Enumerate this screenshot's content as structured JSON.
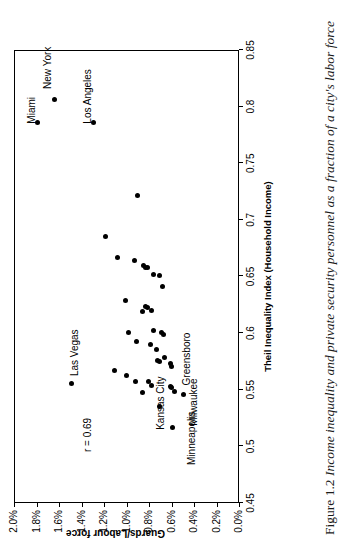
{
  "figure": {
    "number": "Figure 1.2",
    "caption": "Income inequality and private security personnel as a fraction of a city's labor force",
    "full_caption": "Figure 1.2  Income inequality and private security personnel as a fraction of a city's labor force"
  },
  "chart_data": {
    "type": "scatter",
    "title": "",
    "xlabel": "Theil Inequality Index (Household Income)",
    "ylabel": "Guards/Labour force",
    "xlim": [
      0.45,
      0.85
    ],
    "ylim": [
      0.0,
      2.0
    ],
    "xticks": [
      0.45,
      0.5,
      0.55,
      0.6,
      0.65,
      0.7,
      0.75,
      0.8,
      0.85
    ],
    "xticklabels": [
      "0.45",
      "0.5",
      "0.55",
      "0.6",
      "0.65",
      "0.7",
      "0.75",
      "0.8",
      "0.85"
    ],
    "yticks": [
      0.0,
      0.2,
      0.4,
      0.6,
      0.8,
      1.0,
      1.2,
      1.4,
      1.6,
      1.8,
      2.0
    ],
    "yticklabels": [
      "0.0%",
      "0.2%",
      "0.4%",
      "0.6%",
      "0.8%",
      "1.0%",
      "1.2%",
      "1.4%",
      "1.6%",
      "1.8%",
      "2.0%"
    ],
    "grid": false,
    "legend": false,
    "annotations": [
      {
        "text": "r = 0.69",
        "x": 0.495,
        "y": 1.4
      }
    ],
    "points": [
      {
        "x": 0.785,
        "y": 1.8,
        "label": "Miami",
        "label_dx": 0.0,
        "label_dy": 0.17
      },
      {
        "x": 0.805,
        "y": 1.65,
        "label": "New York",
        "label_dx": 0.012,
        "label_dy": 0.17
      },
      {
        "x": 0.785,
        "y": 1.3,
        "label": "Los Angeles",
        "label_dx": 0.0,
        "label_dy": 0.17
      },
      {
        "x": 0.555,
        "y": 1.5,
        "label": "Las Vegas",
        "label_dx": 0.005,
        "label_dy": 0.0
      },
      {
        "x": 0.721,
        "y": 0.91,
        "label": null
      },
      {
        "x": 0.684,
        "y": 1.2,
        "label": null
      },
      {
        "x": 0.666,
        "y": 1.09,
        "label": null
      },
      {
        "x": 0.663,
        "y": 0.94,
        "label": null
      },
      {
        "x": 0.657,
        "y": 0.84,
        "label": null
      },
      {
        "x": 0.657,
        "y": 0.82,
        "label": null
      },
      {
        "x": 0.659,
        "y": 0.86,
        "label": null
      },
      {
        "x": 0.651,
        "y": 0.77,
        "label": null
      },
      {
        "x": 0.65,
        "y": 0.72,
        "label": null
      },
      {
        "x": 0.64,
        "y": 0.69,
        "label": null
      },
      {
        "x": 0.628,
        "y": 1.02,
        "label": null
      },
      {
        "x": 0.623,
        "y": 0.84,
        "label": null
      },
      {
        "x": 0.622,
        "y": 0.82,
        "label": null
      },
      {
        "x": 0.619,
        "y": 0.79,
        "label": null
      },
      {
        "x": 0.618,
        "y": 0.87,
        "label": null
      },
      {
        "x": 0.6,
        "y": 0.99,
        "label": null
      },
      {
        "x": 0.601,
        "y": 0.77,
        "label": null
      },
      {
        "x": 0.6,
        "y": 0.7,
        "label": null
      },
      {
        "x": 0.598,
        "y": 0.68,
        "label": null
      },
      {
        "x": 0.592,
        "y": 0.92,
        "label": null
      },
      {
        "x": 0.589,
        "y": 0.8,
        "label": null
      },
      {
        "x": 0.585,
        "y": 0.74,
        "label": null
      },
      {
        "x": 0.578,
        "y": 0.67,
        "label": null
      },
      {
        "x": 0.575,
        "y": 0.73,
        "label": null
      },
      {
        "x": 0.574,
        "y": 0.72,
        "label": null
      },
      {
        "x": 0.572,
        "y": 0.62,
        "label": null
      },
      {
        "x": 0.57,
        "y": 0.61,
        "label": null
      },
      {
        "x": 0.566,
        "y": 1.12,
        "label": null
      },
      {
        "x": 0.562,
        "y": 1.01,
        "label": null
      },
      {
        "x": 0.556,
        "y": 0.93,
        "label": null
      },
      {
        "x": 0.556,
        "y": 0.81,
        "label": null
      },
      {
        "x": 0.553,
        "y": 0.79,
        "label": null
      },
      {
        "x": 0.552,
        "y": 0.62,
        "label": null
      },
      {
        "x": 0.551,
        "y": 0.61,
        "label": null
      },
      {
        "x": 0.548,
        "y": 0.58,
        "label": null
      },
      {
        "x": 0.547,
        "y": 0.87,
        "label": null,
        "label_key": "kansas"
      },
      {
        "x": 0.534,
        "y": 0.72,
        "label": null
      },
      {
        "x": 0.516,
        "y": 0.6,
        "label": null
      },
      {
        "x": 0.545,
        "y": 0.5,
        "label": null
      }
    ],
    "point_labels": [
      {
        "text": "Miami",
        "x": 0.785,
        "y": 1.8
      },
      {
        "text": "New York",
        "x": 0.805,
        "y": 1.65
      },
      {
        "text": "Los Angeles",
        "x": 0.785,
        "y": 1.3
      },
      {
        "text": "Las Vegas",
        "x": 0.555,
        "y": 1.5
      },
      {
        "text": "Kansas City",
        "x": 0.547,
        "y": 0.87
      },
      {
        "text": "Minneapolis",
        "x": 0.516,
        "y": 0.6
      },
      {
        "text": "Milwaukee",
        "x": 0.548,
        "y": 0.58
      },
      {
        "text": "Greensboro",
        "x": 0.545,
        "y": 0.5
      }
    ],
    "correlation": "r = 0.69",
    "n_points": 43
  }
}
